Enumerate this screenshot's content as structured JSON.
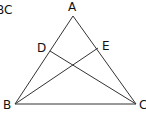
{
  "corner_text": "BC",
  "diagram": {
    "type": "geometry-triangle",
    "points": {
      "A": {
        "label": "A",
        "x": 73,
        "y": 16
      },
      "B": {
        "label": "B",
        "x": 15,
        "y": 104
      },
      "C": {
        "label": "C",
        "x": 136,
        "y": 104
      },
      "D": {
        "label": "D",
        "x": 50,
        "y": 51
      },
      "E": {
        "label": "E",
        "x": 98,
        "y": 48
      }
    },
    "segments": [
      "AB",
      "AC",
      "BC",
      "BE",
      "CD"
    ],
    "stroke_color": "#333333"
  }
}
